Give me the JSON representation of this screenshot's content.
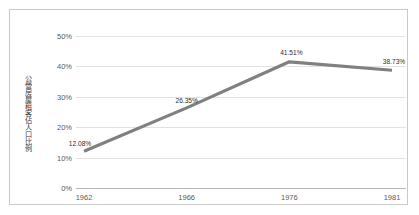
{
  "chart_data": {
    "type": "line",
    "title": "",
    "subtitle": "",
    "xlabel": "",
    "ylabel": "公營房屋租客佔人口比例",
    "categories": [
      "1962",
      "1966",
      "1976",
      "1981"
    ],
    "values": [
      12.08,
      26.35,
      41.51,
      38.73
    ],
    "point_labels": [
      "12.08%",
      "26.35%",
      "41.51%",
      "38.73%"
    ],
    "series": [
      {
        "name": "公營房屋租客佔人口比例",
        "values": [
          12.08,
          26.35,
          41.51,
          38.73
        ],
        "color": "#808080"
      }
    ],
    "ylim": [
      0,
      50
    ],
    "ytick_values": [
      0,
      10,
      20,
      30,
      40,
      50
    ],
    "ytick_labels": [
      "0%",
      "10%",
      "20%",
      "30%",
      "40%",
      "50%"
    ],
    "xtick_labels": [
      "1962",
      "1966",
      "1976",
      "1981"
    ],
    "grid": true,
    "legend": "none",
    "line_color": "#808080",
    "grid_color": "#e2e2e2",
    "axis_color": "#b9b9b9",
    "border_color": "#c9c9c9",
    "background": "#ffffff"
  }
}
